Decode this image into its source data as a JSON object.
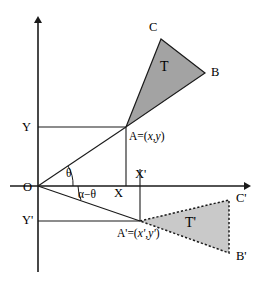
{
  "figure": {
    "type": "geometry-diagram",
    "background_color": "#ffffff",
    "stroke_color": "#1a1a1a"
  },
  "axes": {
    "origin_label": "O",
    "x_axis_name": "x-axis",
    "y_axis_name": "y-axis",
    "origin_px": {
      "x": 38,
      "y": 186
    },
    "x_axis_extent_px": {
      "x1": 10,
      "x2": 248
    },
    "y_axis_extent_px": {
      "y1": 19,
      "y2": 272
    }
  },
  "tick_labels": {
    "y_upper": "Y",
    "x_lower": "X",
    "x_prime": "X'",
    "y_prime": "Y'"
  },
  "angles": [
    {
      "name": "theta",
      "label": "θ",
      "between": "x-axis and OA"
    },
    {
      "name": "alpha-minus-theta",
      "label": "α−θ",
      "between": "x-axis and OA'"
    }
  ],
  "points": [
    {
      "name": "A",
      "label": "A=(x,y)",
      "label_plain": "A=(x,y)",
      "px": {
        "x": 126,
        "y": 127
      }
    },
    {
      "name": "B",
      "label": "B",
      "px": {
        "x": 205,
        "y": 73
      }
    },
    {
      "name": "C",
      "label": "C",
      "px": {
        "x": 161,
        "y": 39
      }
    },
    {
      "name": "A'",
      "label": "A'=(x',y')",
      "label_plain": "A'=(x',y')",
      "px": {
        "x": 140,
        "y": 221
      }
    },
    {
      "name": "B'",
      "label": "B'",
      "px": {
        "x": 229,
        "y": 253
      }
    },
    {
      "name": "C'",
      "label": "C'",
      "px": {
        "x": 229,
        "y": 200
      }
    }
  ],
  "shapes": {
    "triangle_T": {
      "label": "T",
      "vertices": [
        "A",
        "C",
        "B"
      ],
      "fill_color": "#a3a3a3",
      "stroke_style": "solid"
    },
    "triangle_T_prime": {
      "label": "T'",
      "vertices": [
        "A'",
        "C'",
        "B'"
      ],
      "fill_color": "#c9c9c9",
      "stroke_style": "dashed"
    }
  },
  "labels": {
    "A_prefix": "A=(",
    "A_x": "x",
    "A_comma": ",",
    "A_y": "y",
    "A_suffix": ")",
    "Ap_prefix": "A'=(",
    "Ap_x": "x'",
    "Ap_comma": ",",
    "Ap_y": "y'",
    "Ap_suffix": ")"
  }
}
